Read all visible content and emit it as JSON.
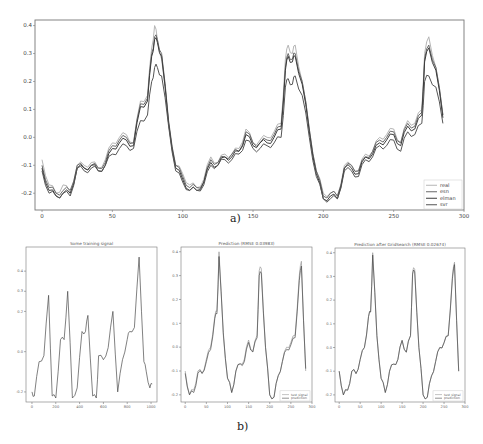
{
  "chart_data": [
    {
      "id": "a",
      "type": "line",
      "caption": "a)",
      "title": "",
      "xlabel": "",
      "ylabel": "",
      "xlim": [
        -5,
        300
      ],
      "ylim": [
        -0.26,
        0.42
      ],
      "xticks": [
        0,
        50,
        100,
        150,
        200,
        250,
        300
      ],
      "yticks": [
        -0.2,
        -0.1,
        0.0,
        0.1,
        0.2,
        0.3,
        0.4
      ],
      "ytick_labels": [
        "-0.2",
        "-0.1",
        "0.0",
        "0.1",
        "0.2",
        "0.3",
        "0.4"
      ],
      "grid": false,
      "legend_position": "lower right",
      "legend": [
        "real",
        "esn",
        "elman",
        "svr"
      ],
      "x": [
        0,
        5,
        10,
        15,
        20,
        25,
        30,
        35,
        40,
        45,
        50,
        55,
        60,
        65,
        70,
        75,
        78,
        80,
        82,
        85,
        90,
        95,
        100,
        105,
        110,
        115,
        120,
        125,
        130,
        135,
        140,
        145,
        150,
        155,
        160,
        165,
        170,
        173,
        175,
        178,
        180,
        185,
        190,
        195,
        200,
        205,
        210,
        215,
        220,
        225,
        230,
        235,
        240,
        245,
        250,
        255,
        260,
        265,
        270,
        272,
        275,
        280,
        285
      ],
      "series": [
        {
          "name": "real",
          "values": [
            -0.08,
            -0.17,
            -0.2,
            -0.17,
            -0.2,
            -0.1,
            -0.1,
            -0.09,
            -0.11,
            -0.08,
            -0.02,
            0.0,
            0.01,
            -0.02,
            0.13,
            0.15,
            0.32,
            0.4,
            0.35,
            0.28,
            0.05,
            -0.1,
            -0.13,
            -0.17,
            -0.18,
            -0.15,
            -0.07,
            -0.09,
            -0.06,
            -0.06,
            -0.04,
            0.03,
            -0.02,
            -0.01,
            0.0,
            0.02,
            0.05,
            0.28,
            0.33,
            0.3,
            0.33,
            0.2,
            0.03,
            -0.12,
            -0.2,
            -0.2,
            -0.21,
            -0.1,
            -0.1,
            -0.12,
            -0.06,
            -0.05,
            0.0,
            0.01,
            0.03,
            -0.02,
            0.06,
            0.05,
            0.1,
            0.3,
            0.36,
            0.25,
            0.08
          ]
        },
        {
          "name": "esn",
          "values": [
            -0.1,
            -0.18,
            -0.2,
            -0.19,
            -0.19,
            -0.1,
            -0.11,
            -0.1,
            -0.11,
            -0.09,
            -0.03,
            -0.01,
            0.0,
            -0.02,
            0.12,
            0.14,
            0.3,
            0.36,
            0.35,
            0.3,
            0.06,
            -0.1,
            -0.14,
            -0.18,
            -0.18,
            -0.16,
            -0.08,
            -0.09,
            -0.07,
            -0.06,
            -0.05,
            0.02,
            -0.02,
            -0.02,
            -0.01,
            0.01,
            0.04,
            0.25,
            0.3,
            0.28,
            0.3,
            0.2,
            0.03,
            -0.12,
            -0.21,
            -0.2,
            -0.21,
            -0.11,
            -0.1,
            -0.12,
            -0.07,
            -0.05,
            -0.01,
            0.0,
            0.02,
            -0.02,
            0.05,
            0.04,
            0.09,
            0.28,
            0.33,
            0.25,
            0.08
          ]
        },
        {
          "name": "elman",
          "values": [
            -0.11,
            -0.19,
            -0.21,
            -0.2,
            -0.2,
            -0.11,
            -0.11,
            -0.1,
            -0.12,
            -0.1,
            -0.04,
            -0.02,
            -0.01,
            -0.03,
            0.11,
            0.13,
            0.29,
            0.35,
            0.34,
            0.29,
            0.05,
            -0.11,
            -0.15,
            -0.19,
            -0.19,
            -0.16,
            -0.09,
            -0.1,
            -0.07,
            -0.07,
            -0.05,
            0.01,
            -0.03,
            -0.02,
            -0.02,
            0.0,
            0.03,
            0.24,
            0.29,
            0.27,
            0.29,
            0.19,
            0.02,
            -0.13,
            -0.22,
            -0.21,
            -0.22,
            -0.11,
            -0.11,
            -0.13,
            -0.07,
            -0.06,
            -0.02,
            -0.01,
            0.01,
            -0.03,
            0.04,
            0.03,
            0.08,
            0.27,
            0.32,
            0.24,
            0.07
          ]
        },
        {
          "name": "svr",
          "values": [
            -0.12,
            -0.2,
            -0.21,
            -0.2,
            -0.21,
            -0.11,
            -0.12,
            -0.11,
            -0.12,
            -0.1,
            -0.06,
            -0.04,
            -0.03,
            -0.04,
            0.06,
            0.08,
            0.2,
            0.25,
            0.25,
            0.22,
            0.04,
            -0.12,
            -0.16,
            -0.19,
            -0.19,
            -0.17,
            -0.1,
            -0.1,
            -0.08,
            -0.08,
            -0.06,
            -0.01,
            -0.04,
            -0.04,
            -0.03,
            -0.02,
            0.0,
            0.18,
            0.21,
            0.19,
            0.22,
            0.15,
            0.0,
            -0.14,
            -0.22,
            -0.22,
            -0.22,
            -0.12,
            -0.12,
            -0.14,
            -0.08,
            -0.07,
            -0.03,
            -0.03,
            -0.01,
            -0.05,
            0.02,
            0.01,
            0.05,
            0.2,
            0.22,
            0.18,
            0.05
          ]
        }
      ]
    },
    {
      "id": "b1",
      "type": "line",
      "caption": "b)",
      "title": "Some training signal",
      "xlim": [
        -50,
        1050
      ],
      "ylim": [
        -0.25,
        0.52
      ],
      "xticks": [
        0,
        200,
        400,
        600,
        800,
        1000
      ],
      "yticks": [
        -0.2,
        0.0,
        0.2,
        0.3,
        0.4
      ],
      "ytick_labels": [
        "-0.2",
        "0.0",
        "0.2",
        "0.3",
        "0.4"
      ],
      "grid": false,
      "legend": [],
      "x": [
        0,
        20,
        60,
        100,
        140,
        170,
        200,
        240,
        270,
        300,
        340,
        380,
        420,
        450,
        470,
        510,
        540,
        560,
        600,
        640,
        680,
        720,
        760,
        800,
        820,
        860,
        900,
        940,
        960,
        990,
        1010
      ],
      "series": [
        {
          "name": "training signal",
          "values": [
            -0.2,
            -0.22,
            -0.05,
            -0.02,
            0.28,
            -0.22,
            -0.23,
            0.06,
            0.06,
            0.3,
            -0.23,
            -0.18,
            0.1,
            0.1,
            0.18,
            -0.22,
            -0.23,
            -0.02,
            -0.04,
            0.02,
            0.2,
            -0.2,
            -0.04,
            0.06,
            0.1,
            0.12,
            0.47,
            -0.05,
            -0.1,
            -0.18,
            -0.16
          ]
        }
      ]
    },
    {
      "id": "b2",
      "type": "line",
      "title": "Prediction (RMSE 0.03983)",
      "xlim": [
        -10,
        300
      ],
      "ylim": [
        -0.23,
        0.42
      ],
      "xticks": [
        0,
        50,
        100,
        150,
        200,
        250,
        300
      ],
      "yticks": [
        -0.2,
        -0.1,
        0.0,
        0.1,
        0.2,
        0.3,
        0.4
      ],
      "ytick_labels": [
        "-0.2",
        "-0.1",
        "0.0",
        "0.1",
        "0.2",
        "0.3",
        "0.4"
      ],
      "grid": false,
      "legend_position": "lower right",
      "legend": [
        "test signal",
        "prediction"
      ],
      "x": [
        0,
        10,
        20,
        30,
        40,
        50,
        60,
        70,
        75,
        80,
        90,
        100,
        110,
        120,
        130,
        140,
        150,
        160,
        170,
        175,
        180,
        190,
        200,
        210,
        220,
        230,
        240,
        250,
        260,
        270,
        275,
        285
      ],
      "series": [
        {
          "name": "test signal",
          "values": [
            -0.1,
            -0.2,
            -0.18,
            -0.1,
            -0.11,
            -0.05,
            0.0,
            0.13,
            0.15,
            0.4,
            0.05,
            -0.13,
            -0.19,
            -0.1,
            -0.07,
            -0.05,
            0.03,
            -0.02,
            0.05,
            0.32,
            0.33,
            0.0,
            -0.2,
            -0.21,
            -0.12,
            -0.06,
            0.0,
            0.02,
            0.05,
            0.3,
            0.36,
            -0.1
          ]
        },
        {
          "name": "prediction",
          "values": [
            -0.11,
            -0.2,
            -0.19,
            -0.11,
            -0.11,
            -0.06,
            -0.01,
            0.12,
            0.14,
            0.38,
            0.06,
            -0.13,
            -0.19,
            -0.1,
            -0.07,
            -0.06,
            0.02,
            -0.02,
            0.04,
            0.3,
            0.31,
            0.0,
            -0.2,
            -0.21,
            -0.12,
            -0.06,
            -0.01,
            0.01,
            0.04,
            0.28,
            0.34,
            -0.09
          ]
        }
      ]
    },
    {
      "id": "b3",
      "type": "line",
      "title": "Prediction after GridSearch (RMSE 0.02674)",
      "xlim": [
        -10,
        300
      ],
      "ylim": [
        -0.23,
        0.42
      ],
      "xticks": [
        0,
        50,
        100,
        150,
        200,
        250,
        300
      ],
      "yticks": [
        -0.2,
        -0.1,
        0.0,
        0.1,
        0.2,
        0.3,
        0.4
      ],
      "ytick_labels": [
        "-0.2",
        "-0.1",
        "0.0",
        "0.1",
        "0.2",
        "0.3",
        "0.4"
      ],
      "grid": false,
      "legend_position": "lower right",
      "legend": [
        "test signal",
        "prediction"
      ],
      "x": [
        0,
        10,
        20,
        30,
        40,
        50,
        60,
        70,
        75,
        80,
        90,
        100,
        110,
        120,
        130,
        140,
        150,
        160,
        170,
        175,
        180,
        190,
        200,
        210,
        220,
        230,
        240,
        250,
        260,
        270,
        275,
        285
      ],
      "series": [
        {
          "name": "test signal",
          "values": [
            -0.1,
            -0.2,
            -0.18,
            -0.1,
            -0.11,
            -0.05,
            0.0,
            0.13,
            0.15,
            0.4,
            0.05,
            -0.13,
            -0.19,
            -0.1,
            -0.07,
            -0.05,
            0.03,
            -0.02,
            0.05,
            0.32,
            0.33,
            0.0,
            -0.2,
            -0.21,
            -0.12,
            -0.06,
            0.0,
            0.02,
            0.05,
            0.3,
            0.36,
            -0.1
          ]
        },
        {
          "name": "prediction",
          "values": [
            -0.1,
            -0.2,
            -0.18,
            -0.1,
            -0.11,
            -0.05,
            0.0,
            0.13,
            0.15,
            0.39,
            0.05,
            -0.13,
            -0.19,
            -0.1,
            -0.07,
            -0.05,
            0.03,
            -0.02,
            0.05,
            0.31,
            0.32,
            0.0,
            -0.2,
            -0.21,
            -0.12,
            -0.06,
            0.0,
            0.02,
            0.05,
            0.29,
            0.35,
            -0.1
          ]
        }
      ]
    }
  ],
  "captions": {
    "a": "a)",
    "b": "b)"
  },
  "colors": {
    "real": "#b5b5b5",
    "esn": "#6a6a6a",
    "elman": "#3c3c3c",
    "svr": "#555555",
    "test": "#9a9a9a",
    "prediction": "#4a4a4a",
    "axis": "#777777"
  },
  "layout": {
    "a": {
      "left": 35,
      "top": 20,
      "right": 464,
      "bottom": 210
    },
    "b1": {
      "left": 26,
      "top": 247,
      "right": 157,
      "bottom": 402
    },
    "b2": {
      "left": 181,
      "top": 247,
      "right": 312,
      "bottom": 402
    },
    "b3": {
      "left": 335,
      "top": 248,
      "right": 465,
      "bottom": 402
    }
  }
}
